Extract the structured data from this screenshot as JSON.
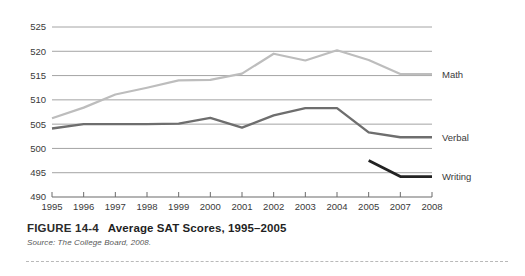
{
  "figure": {
    "number": "FIGURE 14-4",
    "title": "Average SAT Scores, 1995–2005",
    "source": "Source: The College Board, 2008."
  },
  "colors": {
    "math": "#bdbdbd",
    "verbal": "#6e6e6e",
    "writing": "#222222",
    "gridline": "#9a9a9a",
    "axis": "#6b6b6b",
    "text": "#3a3a3a"
  },
  "chart_data": {
    "type": "line",
    "title": "Average SAT Scores, 1995–2005",
    "xlabel": "",
    "ylabel": "",
    "categories": [
      "1995",
      "1996",
      "1997",
      "1998",
      "1999",
      "2000",
      "2001",
      "2002",
      "2003",
      "2004",
      "2005",
      "2007",
      "2008"
    ],
    "ylim": [
      490,
      525
    ],
    "yticks": [
      490,
      495,
      500,
      505,
      510,
      515,
      520,
      525
    ],
    "grid": true,
    "legend_position": "right-inline",
    "series": [
      {
        "name": "Math",
        "color": "#bdbdbd",
        "values": [
          506.2,
          508.4,
          511.1,
          512.5,
          514.0,
          514.1,
          515.4,
          519.5,
          518.1,
          520.2,
          518.2,
          515.3,
          515.3
        ]
      },
      {
        "name": "Verbal",
        "color": "#6e6e6e",
        "values": [
          504.1,
          505.0,
          505.0,
          505.0,
          505.1,
          506.3,
          504.3,
          506.8,
          508.3,
          508.3,
          503.3,
          502.3,
          502.3
        ]
      },
      {
        "name": "Writing",
        "color": "#222222",
        "values": [
          null,
          null,
          null,
          null,
          null,
          null,
          null,
          null,
          null,
          null,
          497.5,
          494.2,
          494.2
        ]
      }
    ]
  },
  "axes": {
    "y_tick_labels": [
      "525",
      "520",
      "515",
      "510",
      "505",
      "500",
      "495",
      "490"
    ],
    "x_tick_labels": [
      "1995",
      "1996",
      "1997",
      "1998",
      "1999",
      "2000",
      "2001",
      "2002",
      "2003",
      "2004",
      "2005",
      "2007",
      "2008"
    ]
  },
  "series_labels": [
    {
      "name": "Math",
      "text": "Math"
    },
    {
      "name": "Verbal",
      "text": "Verbal"
    },
    {
      "name": "Writing",
      "text": "Writing"
    }
  ]
}
